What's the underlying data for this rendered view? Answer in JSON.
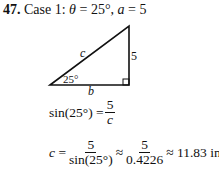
{
  "problem": {
    "number": "47.",
    "case_label": "Case 1:",
    "theta_symbol": "θ",
    "theta_value": "= 25°,",
    "a_symbol": "a",
    "a_value": "= 5"
  },
  "triangle": {
    "hypotenuse_label": "c",
    "vertical_side_label": "5",
    "base_label": "b",
    "angle_label": "25°"
  },
  "equations": {
    "eq1": {
      "lhs": "sin(25°) =",
      "numerator": "5",
      "denominator": "c"
    },
    "eq2": {
      "lhs_var": "c",
      "equals": "=",
      "frac1_num": "5",
      "frac1_den": "sin(25°)",
      "approx1": "≈",
      "frac2_num": "5",
      "frac2_den": "0.4226",
      "result": "≈ 11.83 in."
    }
  }
}
